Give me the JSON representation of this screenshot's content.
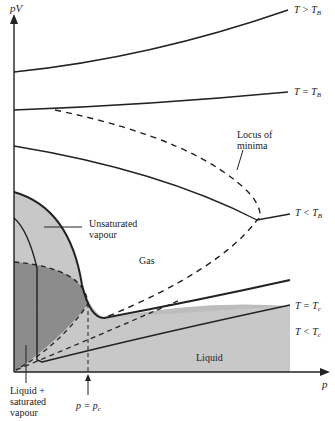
{
  "figure": {
    "axes": {
      "y_label": "pV",
      "x_label": "p"
    },
    "curves": [
      {
        "id": "t-above-tb",
        "label": "T > T",
        "sub": "B"
      },
      {
        "id": "t-equals-tb",
        "label": "T = T",
        "sub": "B"
      },
      {
        "id": "t-below-tb",
        "label": "T < T",
        "sub": "B"
      },
      {
        "id": "t-equals-tc",
        "label": "T = T",
        "sub": "c"
      },
      {
        "id": "t-below-tc",
        "label": "T < T",
        "sub": "c"
      }
    ],
    "annotations": {
      "locus_line1": "Locus of",
      "locus_line2": "minima",
      "unsaturated_line1": "Unsaturated",
      "unsaturated_line2": "vapour",
      "gas": "Gas",
      "liquid": "Liquid",
      "liquid_sat_line1": "Liquid +",
      "liquid_sat_line2": "saturated",
      "liquid_sat_line3": "vapour",
      "critical_pressure": "p = p",
      "critical_pressure_sub": "c"
    },
    "colors": {
      "line": "#222222",
      "light_fill": "#c8c8c8",
      "dark_fill": "#8c8c8c",
      "liquid_fill": "#bdbdbd"
    }
  }
}
